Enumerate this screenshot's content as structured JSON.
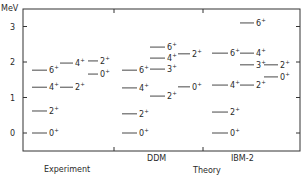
{
  "chart_data": {
    "type": "level-scheme",
    "title": "",
    "ylabel": "MeV",
    "ylim": [
      -0.5,
      3.45
    ],
    "yticks": [
      0,
      1,
      2,
      3
    ],
    "ytick_labels": [
      "0",
      "1",
      "2",
      "3"
    ],
    "grid": false,
    "groups": [
      {
        "label": "Experiment",
        "label_position": "bottom-lower"
      },
      {
        "label": "DDM",
        "label_position": "bottom-upper"
      },
      {
        "label": "IBM-2",
        "label_position": "bottom-upper"
      }
    ],
    "group_caption": "Theory",
    "series": [
      {
        "name": "Experiment",
        "bands": [
          {
            "band": "ground",
            "levels": [
              {
                "spin": "0+",
                "energy": 0.0
              },
              {
                "spin": "2+",
                "energy": 0.62
              },
              {
                "spin": "4+",
                "energy": 1.29
              },
              {
                "spin": "6+",
                "energy": 1.77
              }
            ]
          },
          {
            "band": "gamma",
            "levels": [
              {
                "spin": "2+",
                "energy": 1.29
              },
              {
                "spin": "4+",
                "energy": 1.97
              }
            ]
          },
          {
            "band": "beta",
            "levels": [
              {
                "spin": "0+",
                "energy": 1.66
              },
              {
                "spin": "2+",
                "energy": 2.03
              }
            ]
          }
        ]
      },
      {
        "name": "DDM",
        "bands": [
          {
            "band": "ground",
            "levels": [
              {
                "spin": "0+",
                "energy": 0.0
              },
              {
                "spin": "2+",
                "energy": 0.54
              },
              {
                "spin": "4+",
                "energy": 1.27
              },
              {
                "spin": "6+",
                "energy": 1.77
              }
            ]
          },
          {
            "band": "gamma",
            "levels": [
              {
                "spin": "2+",
                "energy": 1.04
              },
              {
                "spin": "3+",
                "energy": 1.8
              },
              {
                "spin": "4+",
                "energy": 2.11
              },
              {
                "spin": "6+",
                "energy": 2.42
              }
            ]
          },
          {
            "band": "beta",
            "levels": [
              {
                "spin": "0+",
                "energy": 1.3
              },
              {
                "spin": "2+",
                "energy": 2.23
              }
            ]
          }
        ]
      },
      {
        "name": "IBM-2",
        "bands": [
          {
            "band": "ground",
            "levels": [
              {
                "spin": "0+",
                "energy": 0.0
              },
              {
                "spin": "2+",
                "energy": 0.59
              },
              {
                "spin": "4+",
                "energy": 1.35
              },
              {
                "spin": "6+",
                "energy": 2.25
              }
            ]
          },
          {
            "band": "gamma",
            "levels": [
              {
                "spin": "2+",
                "energy": 1.35
              },
              {
                "spin": "3+",
                "energy": 1.92
              },
              {
                "spin": "4+",
                "energy": 2.25
              },
              {
                "spin": "6+",
                "energy": 3.1
              }
            ]
          },
          {
            "band": "beta",
            "levels": [
              {
                "spin": "0+",
                "energy": 1.58
              },
              {
                "spin": "2+",
                "energy": 1.92
              }
            ]
          }
        ]
      }
    ]
  },
  "labels": {
    "y_unit": "MeV",
    "experiment": "Experiment",
    "ddm": "DDM",
    "ibm2": "IBM-2",
    "theory": "Theory"
  }
}
